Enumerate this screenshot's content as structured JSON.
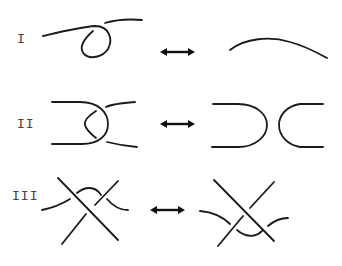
{
  "diagram": {
    "rows": [
      {
        "label": "I",
        "left": "strand with a single twist loop",
        "right": "simple arc",
        "arrow": "double-headed-arrow"
      },
      {
        "label": "II",
        "left": "two strands overlapping with two crossings",
        "right": "two separated arcs",
        "arrow": "double-headed-arrow"
      },
      {
        "label": "III",
        "left": "three strands, third strand passing above the crossing",
        "right": "three strands, third strand passing below the crossing",
        "arrow": "double-headed-arrow"
      }
    ],
    "colors": {
      "stroke": "#1a1a1a",
      "label": "#444444",
      "background": "#ffffff"
    }
  }
}
